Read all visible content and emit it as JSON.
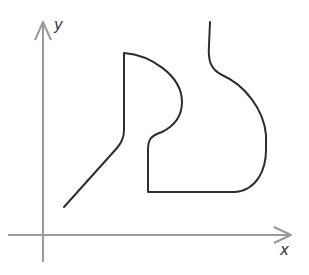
{
  "diagram": {
    "type": "function-sketch",
    "axes": {
      "x_label": "x",
      "y_label": "y",
      "axis_color": "#9a9a9a",
      "curve_color": "#2e2e2e"
    },
    "curves": [
      {
        "name": "left-curve",
        "description": "Line rising diagonally, then vertical up, then arc bulging right, descending to a step, vertical down, horizontal right, then curving up and continuing to top"
      }
    ]
  }
}
